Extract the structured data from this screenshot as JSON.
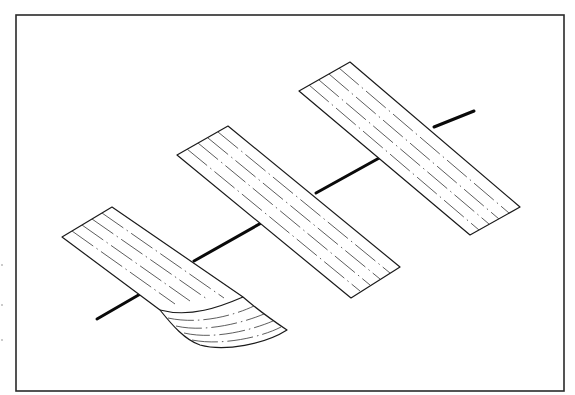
{
  "figure": {
    "frame": {
      "x": 16,
      "y": 15,
      "width": 548,
      "height": 376,
      "stroke": "#2a2a2a"
    },
    "axis": {
      "color": "#0a0a0a",
      "segments": [
        {
          "x1": 97,
          "y1": 319,
          "x2": 142,
          "y2": 293
        },
        {
          "x1": 194,
          "y1": 261,
          "x2": 263,
          "y2": 222
        },
        {
          "x1": 316,
          "y1": 193,
          "x2": 381,
          "y2": 157
        },
        {
          "x1": 434,
          "y1": 127,
          "x2": 474,
          "y2": 111
        }
      ]
    },
    "strips": [
      {
        "id": "strip-1-curled",
        "curled": true,
        "flat_corners": {
          "top": [
            112,
            207
          ],
          "left": [
            62,
            237
          ]
        },
        "flat_end": {
          "right": [
            243,
            297
          ],
          "left": [
            160,
            310
          ]
        },
        "curl_end": {
          "right": [
            287,
            330
          ],
          "left": [
            200,
            345
          ]
        },
        "inner_lines": 4
      },
      {
        "id": "strip-2",
        "curled": false,
        "corners": {
          "top": [
            228,
            126
          ],
          "left": [
            177,
            155
          ],
          "bottom": [
            351,
            298
          ],
          "right": [
            400,
            267
          ]
        },
        "inner_lines": 4
      },
      {
        "id": "strip-3",
        "curled": false,
        "corners": {
          "top": [
            350,
            62
          ],
          "left": [
            299,
            91
          ],
          "bottom": [
            470,
            235
          ],
          "right": [
            520,
            207
          ]
        },
        "inner_lines": 4
      }
    ],
    "line_style": {
      "inner_lines": "dash-dot",
      "outline_color": "#1a1a1a"
    },
    "edge_artifacts": [
      {
        "x": 2,
        "y": 265
      },
      {
        "x": 2,
        "y": 305
      },
      {
        "x": 2,
        "y": 340
      }
    ]
  }
}
